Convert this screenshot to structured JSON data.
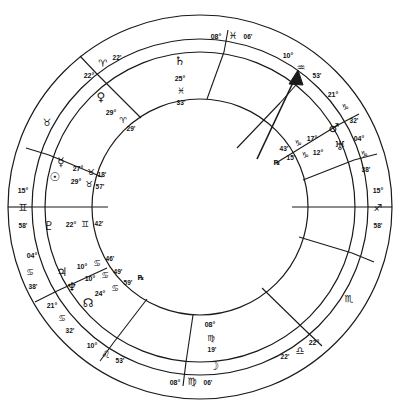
{
  "chart": {
    "type": "astrological-natal-wheel",
    "geometry": {
      "center_x": 200,
      "center_y": 207,
      "outer_radius": 193,
      "sign_ring_inner_radius": 168,
      "house_ring_inner_radius": 108,
      "inner_circle_radius": 108
    },
    "angles": {
      "ascendant": {
        "deg": "15°",
        "sign": "♊",
        "min": "58'",
        "label": "ASC",
        "x": 17,
        "y": 207
      },
      "descendant": {
        "deg": "15°",
        "sign": "♐",
        "min": "58'",
        "label": "DSC",
        "x": 383,
        "y": 207
      },
      "midheaven": {
        "deg": "08°",
        "sign": "♓",
        "min": "06'",
        "label": "MC",
        "x": 200,
        "y": 32
      },
      "imumcoeli": {
        "deg": "08°",
        "sign": "♍",
        "min": "06'",
        "label": "IC",
        "x": 200,
        "y": 383
      }
    },
    "house_cusps": [
      {
        "house": 10,
        "deg": "08°",
        "sign": "♓",
        "min": "06'"
      },
      {
        "house": 11,
        "deg": "10°",
        "sign": "♒",
        "min": "53'"
      },
      {
        "house": 12,
        "deg": "21°",
        "sign": "♑",
        "min": "32'"
      },
      {
        "house": 1,
        "deg": "15°",
        "sign": "♐",
        "min": "58'"
      },
      {
        "house": 2,
        "deg": "04°",
        "sign": "♑",
        "min": "38'"
      },
      {
        "house": 3,
        "deg": "22°",
        "sign": "♎",
        "min": "22'"
      },
      {
        "house": 4,
        "deg": "08°",
        "sign": "♍",
        "min": "06'"
      },
      {
        "house": 5,
        "deg": "10°",
        "sign": "♌",
        "min": "53'"
      },
      {
        "house": 6,
        "deg": "21°",
        "sign": "♋",
        "min": "32'"
      },
      {
        "house": 7,
        "deg": "15°",
        "sign": "♊",
        "min": "58'"
      },
      {
        "house": 8,
        "deg": "04°",
        "sign": "♋",
        "min": "38'"
      },
      {
        "house": 9,
        "deg": "22°",
        "sign": "♈",
        "min": "22'"
      }
    ],
    "outer_ring": {
      "top": {
        "deg": "08°",
        "sign": "♓",
        "min": "06'"
      },
      "upper_right": {
        "deg": "10°",
        "sign": "♒",
        "min": "53'"
      },
      "right_upper": {
        "deg": "21°",
        "sign": "♑",
        "min": "32'"
      },
      "right_mid": {
        "deg": "04°",
        "sign": "♑",
        "min": "38'"
      },
      "right": {
        "deg": "15°",
        "sign": "♐",
        "min": "58'"
      },
      "lower_right": {
        "deg": "22°",
        "sign": "♎",
        "min": "22'"
      },
      "bottom": {
        "deg": "08°",
        "sign": "♍",
        "min": "06'"
      },
      "lower_left": {
        "deg": "10°",
        "sign": "♌",
        "min": "53'"
      },
      "left_lower": {
        "deg": "21°",
        "sign": "♋",
        "min": "32'"
      },
      "left_mid": {
        "deg": "04°",
        "sign": "♋",
        "min": "38'"
      },
      "left": {
        "deg": "15°",
        "sign": "♊",
        "min": "58'"
      },
      "upper_left": {
        "deg": "22°",
        "sign": "♈",
        "min": "22'"
      },
      "sign_taurus": "♉",
      "sign_scorpio": "♏"
    },
    "planets": [
      {
        "key": "saturn",
        "name": "Saturn",
        "glyph": "♄",
        "deg": "25°",
        "sign": "♓",
        "min": "33'",
        "retro": "",
        "x": 178,
        "y": 62,
        "layout": "stacked"
      },
      {
        "key": "venus",
        "name": "Venus",
        "glyph": "♀",
        "deg": "29°",
        "sign": "♈",
        "min": "29'",
        "retro": "",
        "x": 100,
        "y": 97,
        "layout": "diag-right"
      },
      {
        "key": "mercury",
        "name": "Mercury",
        "glyph": "☿",
        "deg": "27°",
        "sign": "♉",
        "min": "18'",
        "retro": "",
        "x": 62,
        "y": 163,
        "layout": "row"
      },
      {
        "key": "sun",
        "name": "Sun",
        "glyph": "☉",
        "deg": "29°",
        "sign": "♉",
        "min": "57'",
        "retro": "",
        "x": 55,
        "y": 176,
        "layout": "row"
      },
      {
        "key": "pluto",
        "name": "Pluto",
        "glyph": "♇",
        "deg": "22°",
        "sign": "♊",
        "min": "42'",
        "retro": "",
        "x": 50,
        "y": 224,
        "layout": "row"
      },
      {
        "key": "jupiter",
        "name": "Jupiter",
        "glyph": "♃",
        "deg": "10°",
        "sign": "♋",
        "min": "46'",
        "retro": "",
        "x": 64,
        "y": 269,
        "layout": "diag"
      },
      {
        "key": "neptune",
        "name": "Neptune",
        "glyph": "♆",
        "deg": "10°",
        "sign": "♋",
        "min": "49'",
        "retro": "",
        "x": 71,
        "y": 283,
        "layout": "diag"
      },
      {
        "key": "northnode",
        "name": "North Node",
        "glyph": "☊",
        "deg": "24°",
        "sign": "♋",
        "min": "59'",
        "retro": "℞",
        "x": 86,
        "y": 302,
        "layout": "diag"
      },
      {
        "key": "moon",
        "name": "Moon",
        "glyph": "☽",
        "deg": "08°",
        "sign": "♍",
        "min": "19'",
        "retro": "",
        "x": 210,
        "y": 362,
        "layout": "stacked"
      },
      {
        "key": "mars",
        "name": "Mars",
        "glyph": "♂",
        "deg": "17°",
        "sign": "♑",
        "min": "43'",
        "retro": "",
        "x": 332,
        "y": 128,
        "layout": "diag-left"
      },
      {
        "key": "uranus",
        "name": "Uranus",
        "glyph": "♅",
        "deg": "12°",
        "sign": "♑",
        "min": "15'",
        "retro": "℞",
        "x": 340,
        "y": 146,
        "layout": "diag-left"
      }
    ],
    "marker": {
      "name": "ascendant-arrow",
      "description": "arrow pointing to 11th house cusp"
    }
  }
}
